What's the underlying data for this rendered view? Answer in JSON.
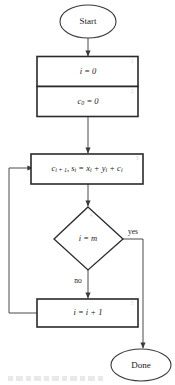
{
  "diagram": {
    "type": "flowchart",
    "orientation": "top-to-bottom",
    "colors": {
      "background": "#ffffff",
      "box_stroke": "#2a2a2a",
      "oval_stroke": "#3a3a3a",
      "connector": "#4a4a4a",
      "text": "#1a1a1a",
      "corner_number": "#d2d2d2"
    },
    "nodes": [
      {
        "id": "start",
        "shape": "oval",
        "label": "Start",
        "number": ""
      },
      {
        "id": "init-i",
        "shape": "rectangle",
        "label": "i = 0",
        "number": "1"
      },
      {
        "id": "init-c0",
        "shape": "rectangle",
        "label": "c0 = 0",
        "number": "2"
      },
      {
        "id": "compute-sum",
        "shape": "rectangle",
        "label": "ci + 1, si = xi + yi + ci",
        "number": "3"
      },
      {
        "id": "decision",
        "shape": "diamond",
        "label": "i = m",
        "number": "4"
      },
      {
        "id": "increment-i",
        "shape": "rectangle",
        "label": "i = i + 1",
        "number": "5"
      },
      {
        "id": "done",
        "shape": "oval",
        "label": "Done",
        "number": ""
      }
    ],
    "edges": [
      {
        "from": "start",
        "to": "init-i",
        "label": ""
      },
      {
        "from": "init-c0",
        "to": "compute-sum",
        "label": ""
      },
      {
        "from": "compute-sum",
        "to": "decision",
        "label": ""
      },
      {
        "from": "decision",
        "to": "done",
        "label": "yes"
      },
      {
        "from": "decision",
        "to": "increment-i",
        "label": "no"
      },
      {
        "from": "increment-i",
        "to": "compute-sum",
        "label": ""
      }
    ],
    "edge_labels": {
      "yes": "yes",
      "no": "no"
    }
  }
}
